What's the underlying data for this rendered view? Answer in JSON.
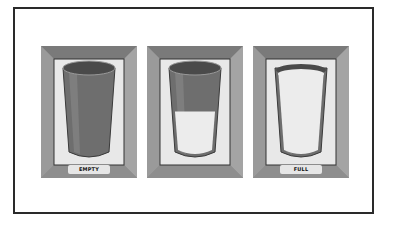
{
  "figure": {
    "panels": [
      {
        "label": "EMPTY",
        "fill_fraction": 0.0
      },
      {
        "label": "",
        "fill_fraction": 0.5
      },
      {
        "label": "FULL",
        "fill_fraction": 1.0
      }
    ],
    "colors": {
      "frame_outer": "#8a8a8a",
      "frame_inner": "#a0a0a0",
      "mat": "#e8e8e8",
      "glass_body": "#6e6e6e",
      "glass_rim_dark": "#4a4a4a",
      "liquid": "#ececec",
      "border": "#2a2a2a"
    }
  }
}
